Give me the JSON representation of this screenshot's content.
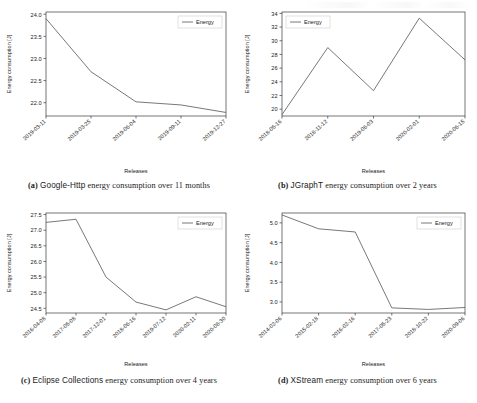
{
  "page": {
    "background": "#ffffff",
    "axis_color": "#3a3a3a",
    "line_color": "#555555",
    "text_color": "#1a1a1a",
    "figure_count": 4
  },
  "figures": [
    {
      "tag": "(a)",
      "name_bold": "Google-Http",
      "caption_rest": "energy consumption over 11 months",
      "caption_full": "(a) Google-Http energy consumption over 11 months",
      "legend_position": "upper right"
    },
    {
      "tag": "(b)",
      "name_bold": "JGraphT",
      "caption_rest": "energy consumption over 2 years",
      "caption_full": "(b) JGraphT energy consumption over 2 years",
      "legend_position": "upper left"
    },
    {
      "tag": "(c)",
      "name_bold": "Eclipse Collections",
      "caption_rest": "energy consumption over 4 years",
      "caption_full": "(c) Eclipse Collections energy consumption over 4 years",
      "legend_position": "upper right"
    },
    {
      "tag": "(d)",
      "name_bold": "XStream",
      "caption_rest": "energy consumption over 6 years",
      "caption_full": "(d) XStream energy consumption over 6 years",
      "legend_position": "upper right"
    }
  ],
  "chart_data": [
    {
      "id": "google-http",
      "type": "line",
      "title": "",
      "xlabel": "Releases",
      "ylabel": "Energy consumption [J]",
      "legend": [
        "Energy"
      ],
      "legend_position": "upper right",
      "grid": false,
      "categories": [
        "2019-03-11",
        "2019-03-25",
        "2019-06-04",
        "2019-09-11",
        "2019-12-27"
      ],
      "values": [
        23.9,
        22.7,
        22.02,
        21.95,
        21.78
      ],
      "ylim": [
        21.7,
        24.05
      ],
      "yticks": [
        22.0,
        22.5,
        23.0,
        23.5,
        24.0
      ],
      "ytick_labels": [
        "22.0",
        "22.5",
        "23.0",
        "23.5",
        "24.0"
      ],
      "series": [
        {
          "name": "Energy",
          "values": [
            23.9,
            22.7,
            22.02,
            21.95,
            21.78
          ]
        }
      ]
    },
    {
      "id": "jgrapht",
      "type": "line",
      "title": "",
      "xlabel": "Releases",
      "ylabel": "Energy consumption [J]",
      "legend": [
        "Energy"
      ],
      "legend_position": "upper left",
      "grid": false,
      "categories": [
        "2018-05-16",
        "2018-11-12",
        "2019-06-03",
        "2020-02-01",
        "2020-06-15"
      ],
      "values": [
        19.2,
        29.0,
        22.7,
        33.3,
        27.2
      ],
      "ylim": [
        19.0,
        34.2
      ],
      "yticks": [
        20,
        22,
        24,
        26,
        28,
        30,
        32,
        34
      ],
      "ytick_labels": [
        "20",
        "22",
        "24",
        "26",
        "28",
        "30",
        "32",
        "34"
      ],
      "series": [
        {
          "name": "Energy",
          "values": [
            19.2,
            29.0,
            22.7,
            33.3,
            27.2
          ]
        }
      ]
    },
    {
      "id": "eclipse-collections",
      "type": "line",
      "title": "",
      "xlabel": "Releases",
      "ylabel": "Energy consumption [J]",
      "legend": [
        "Energy"
      ],
      "legend_position": "upper right",
      "grid": false,
      "categories": [
        "2016-04-08",
        "2017-05-08",
        "2017-12-01",
        "2018-06-16",
        "2019-07-12",
        "2020-02-11",
        "2020-08-30"
      ],
      "values": [
        27.25,
        27.35,
        25.5,
        24.7,
        24.45,
        24.87,
        24.55
      ],
      "ylim": [
        24.35,
        27.55
      ],
      "yticks": [
        24.5,
        25.0,
        25.5,
        26.0,
        26.5,
        27.0,
        27.5
      ],
      "ytick_labels": [
        "24.5",
        "25.0",
        "25.5",
        "26.0",
        "26.5",
        "27.0",
        "27.5"
      ],
      "series": [
        {
          "name": "Energy",
          "values": [
            27.25,
            27.35,
            25.5,
            24.7,
            24.45,
            24.87,
            24.55
          ]
        }
      ]
    },
    {
      "id": "xstream",
      "type": "line",
      "title": "",
      "xlabel": "Releases",
      "ylabel": "Energy consumption [J]",
      "legend": [
        "Energy"
      ],
      "legend_position": "upper right",
      "grid": false,
      "categories": [
        "2014-02-06",
        "2015-02-18",
        "2016-02-16",
        "2017-05-23",
        "2018-10-22",
        "2020-09-06"
      ],
      "values": [
        5.2,
        4.85,
        4.77,
        2.85,
        2.81,
        2.86
      ],
      "ylim": [
        2.72,
        5.25
      ],
      "yticks": [
        3.0,
        3.5,
        4.0,
        4.5,
        5.0
      ],
      "ytick_labels": [
        "3.0",
        "3.5",
        "4.0",
        "4.5",
        "5.0"
      ],
      "series": [
        {
          "name": "Energy",
          "values": [
            5.2,
            4.85,
            4.77,
            2.85,
            2.81,
            2.86
          ]
        }
      ]
    }
  ]
}
